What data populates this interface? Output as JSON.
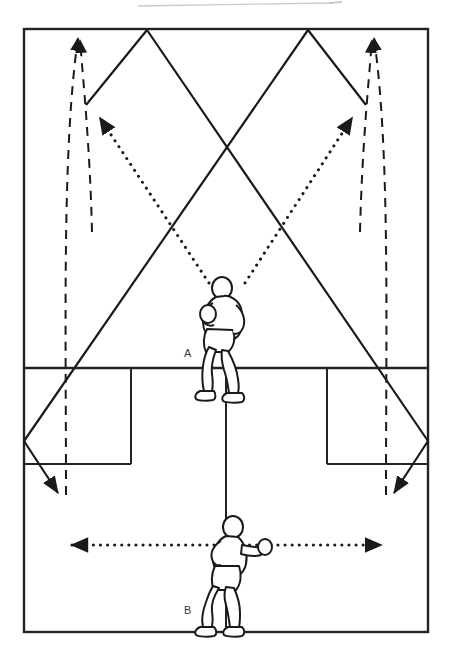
{
  "diagram": {
    "title_visible": false,
    "kind": "badminton-court-drill-diagram",
    "canvas": {
      "width": 452,
      "height": 652
    },
    "colors": {
      "ink": "#1a1a1a",
      "court_line": "#232323",
      "label": "#3a3a3a",
      "artifact": "#b8b8b8",
      "background": "#ffffff"
    },
    "labels": [
      {
        "name": "player-a-label",
        "text": "A",
        "x": 184,
        "y": 357
      },
      {
        "name": "player-b-label",
        "text": "B",
        "x": 184,
        "y": 614
      }
    ],
    "court": {
      "outer": {
        "x": 24,
        "y": 29,
        "width": 404,
        "height": 603
      },
      "short_service_line_y": 368,
      "service_box_bottom_y": 464,
      "centre_line_x": 226,
      "left_service_box": {
        "x": 24,
        "y": 368,
        "width": 107,
        "height": 96
      },
      "right_service_box": {
        "x": 327,
        "y": 368,
        "width": 101,
        "height": 96
      },
      "centre_line_top_y": 368,
      "centre_line_bottom_y": 632
    },
    "players": [
      {
        "name": "player-a",
        "label": "A",
        "x": 226,
        "y": 318,
        "facing": "left"
      },
      {
        "name": "player-b",
        "label": "B",
        "x": 226,
        "y": 570,
        "facing": "right"
      }
    ],
    "solid_shuttle_paths": {
      "stroke_width": 2,
      "description": "Solid lines: shuttle trajectories from rear corners crossing to opposite front corners, rebounding at the side lines",
      "polylines": [
        [
          [
            78,
            30
          ],
          [
            147,
            30
          ],
          [
            36,
            440
          ],
          [
            24,
            441
          ],
          [
            60,
            495
          ]
        ],
        [
          [
            147,
            30
          ],
          [
            308,
            30
          ]
        ],
        [
          [
            308,
            30
          ],
          [
            428,
            441
          ],
          [
            416,
            441
          ],
          [
            392,
            495
          ]
        ]
      ],
      "segments": [
        {
          "name": "left-apex-down-right",
          "points": [
            [
              147,
              30
            ],
            [
              358,
              104
            ],
            [
              392,
              495
            ]
          ]
        },
        {
          "name": "right-apex-down-left",
          "points": [
            [
              308,
              30
            ],
            [
              96,
              104
            ],
            [
              60,
              495
            ]
          ]
        },
        {
          "name": "left-rebound",
          "points": [
            [
              24,
              441
            ],
            [
              60,
              495
            ]
          ]
        },
        {
          "name": "right-rebound",
          "points": [
            [
              428,
              441
            ],
            [
              392,
              495
            ]
          ]
        }
      ]
    },
    "dotted_paths": {
      "stroke_width": 3,
      "dot_spacing": 7,
      "description": "Dotted arrows: player A's shot directions to the two rear corners; player B's side-to-side movement",
      "arrows": [
        {
          "name": "dotted-arrow-a-left",
          "from": [
            209,
            285
          ],
          "to": [
            96,
            113
          ],
          "arrowhead": "end"
        },
        {
          "name": "dotted-arrow-a-right",
          "from": [
            243,
            285
          ],
          "to": [
            356,
            113
          ],
          "arrowhead": "end"
        },
        {
          "name": "dotted-arrow-b-horizontal",
          "from": [
            65,
            545
          ],
          "to": [
            388,
            545
          ],
          "arrowhead": "both"
        }
      ]
    },
    "dashed_paths": {
      "stroke_width": 2,
      "dash": "8 6",
      "description": "Dashed lines: player movement/recovery routes to the rear corners",
      "routes": [
        {
          "name": "dashed-route-left-outer",
          "points": [
            [
              78,
              33
            ],
            [
              66,
              210
            ],
            [
              66,
              495
            ]
          ],
          "arrowhead": "start"
        },
        {
          "name": "dashed-route-left-inner",
          "points": [
            [
              78,
              33
            ],
            [
              88,
              150
            ],
            [
              88,
              230
            ]
          ],
          "arrowhead": "start"
        },
        {
          "name": "dashed-route-right-outer",
          "points": [
            [
              374,
              33
            ],
            [
              386,
              210
            ],
            [
              386,
              495
            ]
          ],
          "arrowhead": "start"
        },
        {
          "name": "dashed-route-right-inner",
          "points": [
            [
              374,
              33
            ],
            [
              364,
              150
            ],
            [
              364,
              230
            ]
          ],
          "arrowhead": "start"
        }
      ]
    },
    "scan_artifact": {
      "name": "scan-line-artifact",
      "x1": 138,
      "y1": 5,
      "x2": 330,
      "y2": 2,
      "opacity": 0.45
    }
  }
}
